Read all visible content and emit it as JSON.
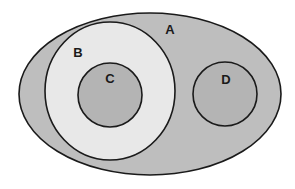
{
  "diagram": {
    "type": "venn-euler",
    "background": "#ffffff",
    "outline_color": "#1a1a1a",
    "sets": [
      {
        "id": "A",
        "label": "A",
        "shape": "ellipse",
        "cx": 150,
        "cy": 94,
        "rx": 131,
        "ry": 81,
        "fill": "#bebebe",
        "label_x": 170,
        "label_y": 34,
        "contains": [
          "B",
          "D"
        ]
      },
      {
        "id": "B",
        "label": "B",
        "shape": "ellipse",
        "cx": 110,
        "cy": 91,
        "rx": 65,
        "ry": 69,
        "fill": "#e8e8e8",
        "label_x": 78,
        "label_y": 57,
        "contains": [
          "C"
        ]
      },
      {
        "id": "C",
        "label": "C",
        "shape": "circle",
        "cx": 110,
        "cy": 95,
        "r": 32,
        "fill": "#b4b4b4",
        "label_x": 110,
        "label_y": 83,
        "contains": []
      },
      {
        "id": "D",
        "label": "D",
        "shape": "circle",
        "cx": 225,
        "cy": 94,
        "r": 32,
        "fill": "#b4b4b4",
        "label_x": 226,
        "label_y": 84,
        "contains": []
      }
    ]
  },
  "labels": {
    "A": "A",
    "B": "B",
    "C": "C",
    "D": "D"
  }
}
